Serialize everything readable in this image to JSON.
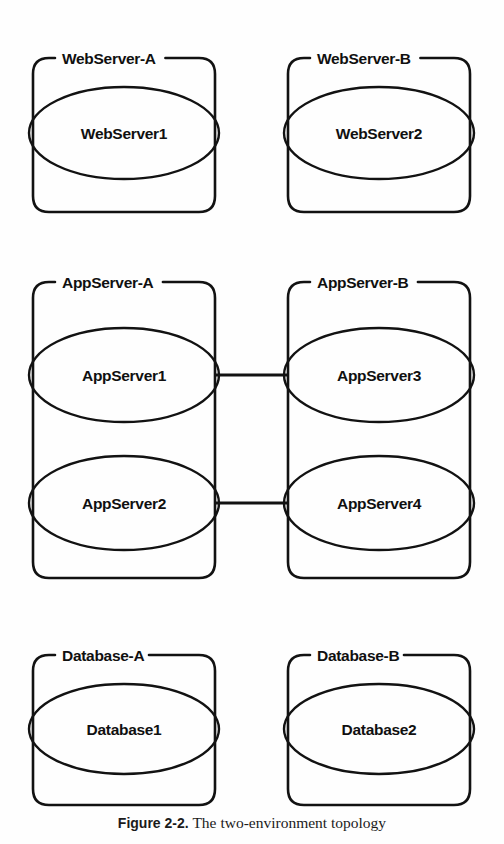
{
  "figure": {
    "background_color": "#fefefe",
    "stroke_color": "#121212",
    "caption_number": "Figure 2-2.",
    "caption_body": "The two-environment topology"
  },
  "diagram": {
    "type": "topology-diagram",
    "tiers": [
      {
        "tier_name": "web-tier",
        "groups": [
          {
            "id": "webserver-a",
            "label": "WebServer-A",
            "x": 33,
            "y": 58,
            "w": 182,
            "h": 154,
            "nodes": [
              {
                "id": "webserver1",
                "label": "WebServer1",
                "cx": 124,
                "cy": 133,
                "rx": 95,
                "ry": 46
              }
            ]
          },
          {
            "id": "webserver-b",
            "label": "WebServer-B",
            "x": 288,
            "y": 58,
            "w": 182,
            "h": 154,
            "nodes": [
              {
                "id": "webserver2",
                "label": "WebServer2",
                "cx": 379,
                "cy": 133,
                "rx": 95,
                "ry": 46
              }
            ]
          }
        ]
      },
      {
        "tier_name": "app-tier",
        "groups": [
          {
            "id": "appserver-a",
            "label": "AppServer-A",
            "x": 33,
            "y": 282,
            "w": 182,
            "h": 296,
            "nodes": [
              {
                "id": "appserver1",
                "label": "AppServer1",
                "cx": 124,
                "cy": 375,
                "rx": 95,
                "ry": 47
              },
              {
                "id": "appserver2",
                "label": "AppServer2",
                "cx": 124,
                "cy": 503,
                "rx": 95,
                "ry": 47
              }
            ]
          },
          {
            "id": "appserver-b",
            "label": "AppServer-B",
            "x": 288,
            "y": 282,
            "w": 182,
            "h": 296,
            "nodes": [
              {
                "id": "appserver3",
                "label": "AppServer3",
                "cx": 379,
                "cy": 375,
                "rx": 95,
                "ry": 47
              },
              {
                "id": "appserver4",
                "label": "AppServer4",
                "cx": 379,
                "cy": 503,
                "rx": 95,
                "ry": 47
              }
            ]
          }
        ]
      },
      {
        "tier_name": "database-tier",
        "groups": [
          {
            "id": "database-a",
            "label": "Database-A",
            "x": 33,
            "y": 655,
            "w": 182,
            "h": 150,
            "nodes": [
              {
                "id": "database1",
                "label": "Database1",
                "cx": 124,
                "cy": 729,
                "rx": 95,
                "ry": 45
              }
            ]
          },
          {
            "id": "database-b",
            "label": "Database-B",
            "x": 288,
            "y": 655,
            "w": 182,
            "h": 150,
            "nodes": [
              {
                "id": "database2",
                "label": "Database2",
                "cx": 379,
                "cy": 729,
                "rx": 95,
                "ry": 45
              }
            ]
          }
        ]
      }
    ],
    "connectors": [
      {
        "id": "connector-appserver1-appserver3",
        "x1": 215,
        "y1": 375,
        "x2": 288,
        "y2": 375
      },
      {
        "id": "connector-appserver2-appserver4",
        "x1": 215,
        "y1": 503,
        "x2": 288,
        "y2": 503
      }
    ]
  }
}
